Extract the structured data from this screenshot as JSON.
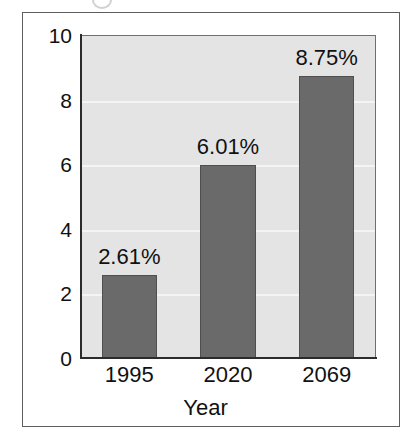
{
  "figure": {
    "background_color": "#ffffff",
    "frame_color": "#5d5d5d",
    "top_crop_fragment": true
  },
  "chart_data": {
    "type": "bar",
    "title": "",
    "subtitle": "",
    "xlabel": "Year",
    "ylabel": "",
    "categories": [
      "1995",
      "2020",
      "2069"
    ],
    "values": [
      2.61,
      6.01,
      8.75
    ],
    "data_labels": [
      "2.61%",
      "6.01%",
      "8.75%"
    ],
    "ylim": [
      0,
      10
    ],
    "xlim": [
      0,
      3
    ],
    "y_ticks": [
      0,
      2,
      4,
      6,
      8,
      10
    ],
    "y_tick_labels": [
      "0",
      "2",
      "4",
      "6",
      "8",
      "10"
    ],
    "x_tick_labels": [
      "1995",
      "2020",
      "2069"
    ],
    "grid": true,
    "grid_axis": "y",
    "grid_color": "#f4f4f4",
    "legend": false,
    "legend_position": "none",
    "bar_color": "#6a6a6a",
    "bar_edge_color": "#4f4f4f",
    "plot_background_color": "#e4e4e4",
    "axis_color": "#2b2b2b",
    "annotations": []
  }
}
